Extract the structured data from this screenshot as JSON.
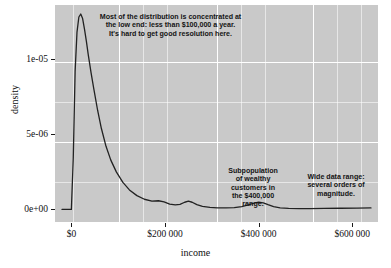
{
  "chart_data": {
    "type": "line",
    "title": "",
    "subtitle": "",
    "xlabel": "income",
    "ylabel": "density",
    "xlim": [
      -35000,
      655000
    ],
    "ylim": [
      -9e-07,
      1.36e-05
    ],
    "grid": true,
    "legend": null,
    "xticks": [
      0,
      200000,
      400000,
      600000
    ],
    "xticklabels": [
      "$0",
      "$200 000",
      "$400 000",
      "$600 000"
    ],
    "yticks": [
      0,
      5e-06,
      1e-05
    ],
    "yticklabels": [
      "0e+00",
      "5e-06",
      "1e-05"
    ],
    "series": [
      {
        "name": "income density",
        "x": [
          -20000,
          -8000,
          0,
          4000,
          8000,
          12000,
          16000,
          20000,
          24000,
          28000,
          32000,
          36000,
          42000,
          48000,
          56000,
          64000,
          74000,
          84000,
          96000,
          110000,
          124000,
          140000,
          156000,
          172000,
          186000,
          198000,
          210000,
          222000,
          232000,
          242000,
          250000,
          258000,
          268000,
          280000,
          296000,
          312000,
          330000,
          348000,
          364000,
          378000,
          390000,
          400000,
          410000,
          420000,
          432000,
          446000,
          464000,
          486000,
          510000,
          540000,
          575000,
          610000,
          640000
        ],
        "y": [
          0.0,
          0.0,
          0.0,
          3.4e-06,
          9.2e-06,
          1.18e-05,
          1.28e-05,
          1.3e-05,
          1.27e-05,
          1.2e-05,
          1.12e-05,
          1.03e-05,
          9.1e-06,
          8e-06,
          6.6e-06,
          5.4e-06,
          4.2e-06,
          3.3e-06,
          2.5e-06,
          1.8e-06,
          1.3e-06,
          9.2e-07,
          6.8e-07,
          5.6e-07,
          5.8e-07,
          5e-07,
          3.6e-07,
          3e-07,
          3.4e-07,
          4.8e-07,
          5.5e-07,
          4.8e-07,
          3.2e-07,
          2e-07,
          1.4e-07,
          1.1e-07,
          1e-07,
          1.2e-07,
          1.9e-07,
          3e-07,
          4.2e-07,
          4.8e-07,
          4.4e-07,
          3.2e-07,
          1.9e-07,
          1.1e-07,
          7e-08,
          6e-08,
          6e-08,
          7e-08,
          8e-08,
          9e-08,
          1e-07
        ],
        "color": "#222222",
        "linewidth": 1.3
      }
    ],
    "annotations": [
      {
        "id": "main",
        "text": "Most of the distribution is concentrated at\nthe low end: less than $100,000 a year.\nIt's hard to get good resolution here."
      },
      {
        "id": "subpopulation",
        "text": "Subpopulation\nof wealthy\ncustomers in\nthe $400,000\nrange."
      },
      {
        "id": "range",
        "text": "Wide data range:\nseveral orders of\nmagnitude."
      }
    ],
    "colors": {
      "panel_background": "#c9c9c9",
      "gridline": "#ffffff",
      "curve": "#222222",
      "text": "#111111",
      "annotation_text": "#141414",
      "page_background": "#ffffff"
    }
  }
}
